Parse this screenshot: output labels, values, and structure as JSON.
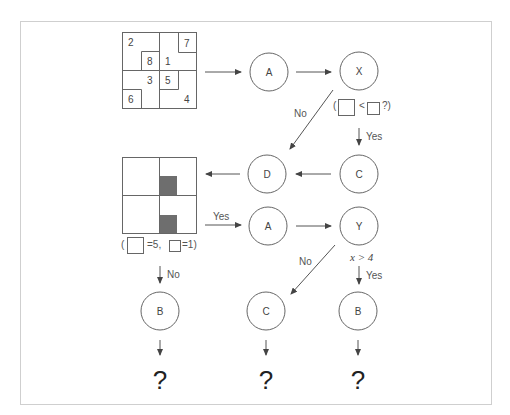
{
  "diagram": {
    "grid1": {
      "numbers": [
        "2",
        "7",
        "8",
        "1",
        "3",
        "5",
        "6",
        "4"
      ]
    },
    "nodes": {
      "top_a": "A",
      "top_x": "X",
      "mid_d": "D",
      "mid_c": "C",
      "mid_a": "A",
      "mid_y": "Y",
      "bot_b1": "B",
      "bot_c": "C",
      "bot_b2": "B"
    },
    "edges": {
      "x_to_d_label": "No",
      "x_to_c_label": "Yes",
      "grid2_to_a_label": "Yes",
      "grid2_to_b_label": "No",
      "y_to_c_label": "No",
      "y_to_b_label": "Yes"
    },
    "conditions": {
      "x_condition_open": "(",
      "x_condition_op": "<",
      "x_condition_close": "?)",
      "grid2_open": "(",
      "grid2_val_big": "=5,",
      "grid2_val_small": "=1)",
      "y_condition": "x > 4"
    },
    "outputs": [
      "?",
      "?",
      "?"
    ],
    "colors": {
      "line": "#555555",
      "shade": "#6e6e6e",
      "frame": "#cccccc"
    }
  }
}
